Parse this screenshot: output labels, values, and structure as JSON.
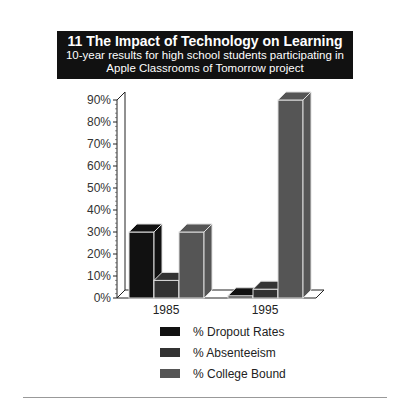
{
  "header": {
    "title": "11   The Impact of Technology on Learning",
    "subtitle_1": "10-year results for high school students participating in",
    "subtitle_2": "Apple Classrooms of Tomorrow project"
  },
  "colors": {
    "dropout": "#111111",
    "absenteeism": "#333333",
    "college": "#555555"
  },
  "chart_data": {
    "type": "bar",
    "title": "The Impact of Technology on Learning",
    "subtitle": "10-year results for high school students participating in Apple Classrooms of Tomorrow project",
    "categories": [
      "1985",
      "1995"
    ],
    "series": [
      {
        "name": "% Dropout Rates",
        "values": [
          30,
          1
        ]
      },
      {
        "name": "% Absenteeism",
        "values": [
          8,
          4
        ]
      },
      {
        "name": "% College Bound",
        "values": [
          30,
          90
        ]
      }
    ],
    "yticks": [
      "0%",
      "10%",
      "20%",
      "30%",
      "40%",
      "50%",
      "60%",
      "70%",
      "80%",
      "90%"
    ],
    "ylim": [
      0,
      90
    ],
    "xlabel": "",
    "ylabel": "",
    "legend_position": "bottom",
    "grid": false
  },
  "legend": [
    "% Dropout Rates",
    "% Absenteeism",
    "% College Bound"
  ]
}
